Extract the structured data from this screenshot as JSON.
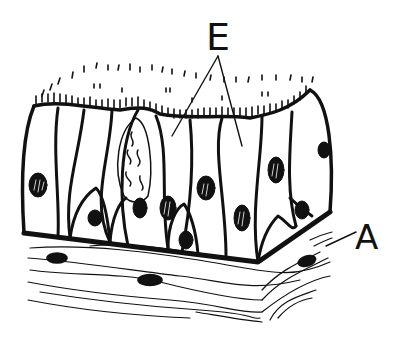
{
  "figure": {
    "style": "black ink line drawing on white",
    "colors": {
      "ink": "#111111",
      "background": "#ffffff"
    }
  },
  "labels": {
    "E": {
      "text": "E",
      "pointers": 2,
      "points_to": "epithelial cells"
    },
    "A": {
      "text": "A",
      "pointers": 1,
      "points_to": "underlying connective tissue"
    }
  }
}
